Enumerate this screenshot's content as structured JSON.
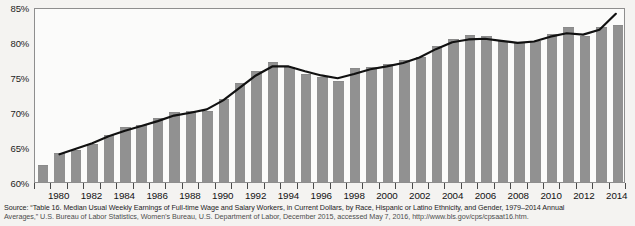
{
  "figure": {
    "caption_line1": "Source: “Table 16. Median Usual Weekly Earnings of Full-time Wage and Salary Workers, in Current Dollars, by Race, Hispanic or Latino Ethnicity, and Gender, 1979–2014 Annual",
    "caption_line2": "Averages,” U.S. Bureau of Labor Statistics, Women’s Bureau, U.S. Department of Labor, December 2015, accessed May 7, 2016, http://www.bls.gov/cps/cpsaat16.htm.",
    "bar_color": "#919191",
    "line_color": "#111111",
    "plot_background": "#fbfbfa",
    "page_background": "#f4f3f1"
  },
  "chart_data": {
    "type": "bar",
    "title": "",
    "xlabel": "",
    "ylabel": "",
    "ylim": [
      60,
      85
    ],
    "ytick_labels": [
      "60%",
      "65%",
      "70%",
      "75%",
      "80%",
      "85%"
    ],
    "ytick_values": [
      60,
      65,
      70,
      75,
      80,
      85
    ],
    "grid": false,
    "legend": "none",
    "x": [
      1979,
      1980,
      1981,
      1982,
      1983,
      1984,
      1985,
      1986,
      1987,
      1988,
      1989,
      1990,
      1991,
      1992,
      1993,
      1994,
      1995,
      1996,
      1997,
      1998,
      1999,
      2000,
      2001,
      2002,
      2003,
      2004,
      2005,
      2006,
      2007,
      2008,
      2009,
      2010,
      2011,
      2012,
      2013,
      2014
    ],
    "xtick_labels": [
      "1980",
      "1982",
      "1984",
      "1986",
      "1988",
      "1990",
      "1992",
      "1994",
      "1996",
      "1998",
      "2000",
      "2002",
      "2004",
      "2006",
      "2008",
      "2010",
      "2012",
      "2014"
    ],
    "xtick_values": [
      1980,
      1982,
      1984,
      1986,
      1988,
      1990,
      1992,
      1994,
      1996,
      1998,
      2000,
      2002,
      2004,
      2006,
      2008,
      2010,
      2012,
      2014
    ],
    "series": [
      {
        "name": "Women's earnings as a percentage of men's",
        "type": "bar",
        "values": [
          62.5,
          64.2,
          64.6,
          65.4,
          66.7,
          67.8,
          68.2,
          69.2,
          70.0,
          70.2,
          70.1,
          71.9,
          74.2,
          75.8,
          77.1,
          76.4,
          75.5,
          75.0,
          74.4,
          76.3,
          76.5,
          76.9,
          77.4,
          77.9,
          79.4,
          80.4,
          81.0,
          80.8,
          80.2,
          79.9,
          80.2,
          81.2,
          82.2,
          80.9,
          82.1,
          82.5
        ]
      },
      {
        "name": "Trend line",
        "type": "line",
        "values": [
          null,
          64.0,
          64.8,
          65.6,
          66.6,
          67.4,
          68.1,
          68.8,
          69.6,
          70.0,
          70.5,
          71.8,
          73.6,
          75.4,
          76.7,
          76.7,
          76.0,
          75.4,
          75.0,
          75.6,
          76.3,
          76.7,
          77.2,
          78.0,
          79.2,
          80.2,
          80.6,
          80.7,
          80.4,
          80.1,
          80.3,
          81.0,
          81.5,
          81.3,
          82.0,
          84.3
        ]
      }
    ]
  }
}
